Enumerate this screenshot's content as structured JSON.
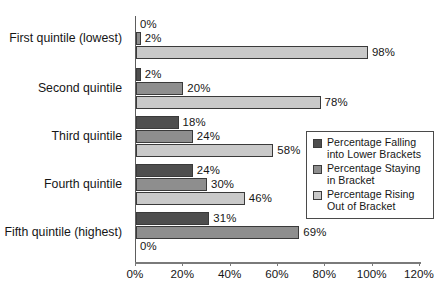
{
  "chart_data": {
    "type": "bar",
    "orientation": "horizontal",
    "title": "",
    "subtitle": "",
    "xlabel": "",
    "ylabel": "",
    "xlim": [
      0,
      120
    ],
    "xtick_labels": [
      "0%",
      "20%",
      "40%",
      "60%",
      "80%",
      "100%",
      "120%"
    ],
    "xtick_values": [
      0,
      20,
      40,
      60,
      80,
      100,
      120
    ],
    "grid": false,
    "legend_position": "middle-right",
    "categories": [
      "First quintile (lowest)",
      "Second quintile",
      "Third quintile",
      "Fourth quintile",
      "Fifth quintile (highest)"
    ],
    "series": [
      {
        "name": "Percentage Falling into Lower Brackets",
        "color": "#4e4e4e",
        "values": [
          0,
          2,
          18,
          24,
          31
        ],
        "labels": [
          "0%",
          "2%",
          "18%",
          "24%",
          "31%"
        ]
      },
      {
        "name": "Percentage Staying in Bracket",
        "color": "#8e8e8e",
        "values": [
          2,
          20,
          24,
          30,
          69
        ],
        "labels": [
          "2%",
          "20%",
          "24%",
          "30%",
          "69%"
        ]
      },
      {
        "name": "Percentage Rising Out of Bracket",
        "color": "#c9c9c9",
        "values": [
          98,
          78,
          58,
          46,
          0
        ],
        "labels": [
          "98%",
          "78%",
          "58%",
          "46%",
          "0%"
        ]
      }
    ]
  },
  "legend": {
    "entries": [
      {
        "label_line1": "Percentage Falling",
        "label_line2": "into Lower Brackets",
        "color": "#4e4e4e"
      },
      {
        "label_line1": "Percentage Staying",
        "label_line2": "in Bracket",
        "color": "#8e8e8e"
      },
      {
        "label_line1": "Percentage Rising",
        "label_line2": "Out of Bracket",
        "color": "#c9c9c9"
      }
    ]
  },
  "colors": {
    "series_dark": "#4e4e4e",
    "series_mid": "#8e8e8e",
    "series_light": "#c9c9c9",
    "axis": "#7a7a7a",
    "text": "#161616",
    "background": "#ffffff"
  }
}
